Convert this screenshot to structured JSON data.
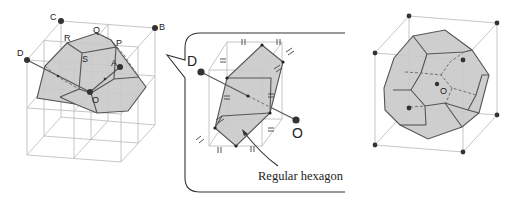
{
  "figure": {
    "left_panel": {
      "name": "Wigner-Seitz cell construction in cube grid",
      "points": {
        "C": "C",
        "B": "B",
        "D": "D",
        "A": "A",
        "O": "O",
        "R": "R",
        "Q": "Q",
        "P": "P",
        "S": "S"
      }
    },
    "middle_panel": {
      "name": "Callout: hexagonal cross section",
      "points": {
        "D": "D",
        "O": "O"
      },
      "caption": "Regular hexagon"
    },
    "right_panel": {
      "name": "Truncated octahedron inside cube",
      "points": {
        "O": "O"
      }
    },
    "colors": {
      "face_fill": "#c9c9c9",
      "edge": "#555555",
      "grid": "#b8b8b8",
      "point": "#333333"
    }
  }
}
